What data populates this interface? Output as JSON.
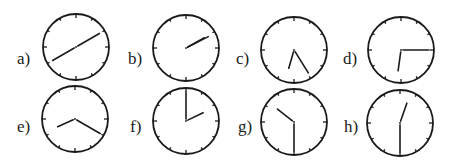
{
  "figure": {
    "clocks": [
      {
        "label": "a)",
        "cx": 76,
        "cy": 47,
        "r": 33,
        "lx": 17,
        "ly": 50,
        "hands": [
          {
            "angle": 60,
            "len": 27,
            "role": "hand-1"
          },
          {
            "angle": 240,
            "len": 27,
            "role": "hand-2"
          }
        ]
      },
      {
        "label": "b)",
        "cx": 186,
        "cy": 48,
        "r": 33,
        "lx": 128,
        "ly": 50,
        "hands": [
          {
            "angle": 63,
            "len": 25,
            "role": "long-hand"
          },
          {
            "angle": 61,
            "len": 21,
            "role": "short-hand"
          }
        ]
      },
      {
        "label": "c)",
        "cx": 294,
        "cy": 50,
        "r": 33,
        "lx": 236,
        "ly": 50,
        "hands": [
          {
            "angle": 148,
            "len": 27,
            "role": "long-hand"
          },
          {
            "angle": 196,
            "len": 19,
            "role": "short-hand"
          }
        ]
      },
      {
        "label": "d)",
        "cx": 401,
        "cy": 50,
        "r": 33,
        "lx": 343,
        "ly": 50,
        "hands": [
          {
            "angle": 90,
            "len": 28,
            "role": "long-hand"
          },
          {
            "angle": 188,
            "len": 21,
            "role": "short-hand"
          }
        ]
      },
      {
        "label": "e)",
        "cx": 75,
        "cy": 119,
        "r": 33,
        "lx": 17,
        "ly": 118,
        "hands": [
          {
            "angle": 120,
            "len": 29,
            "role": "long-hand"
          },
          {
            "angle": 246,
            "len": 19,
            "role": "short-hand"
          }
        ]
      },
      {
        "label": "f)",
        "cx": 186,
        "cy": 121,
        "r": 33,
        "lx": 130,
        "ly": 118,
        "hands": [
          {
            "angle": 0,
            "len": 29,
            "role": "long-hand"
          },
          {
            "angle": 64,
            "len": 19,
            "role": "short-hand"
          }
        ]
      },
      {
        "label": "g)",
        "cx": 294,
        "cy": 122,
        "r": 33,
        "lx": 238,
        "ly": 118,
        "hands": [
          {
            "angle": 180,
            "len": 29,
            "role": "long-hand"
          },
          {
            "angle": 308,
            "len": 21,
            "role": "short-hand"
          }
        ]
      },
      {
        "label": "h)",
        "cx": 400,
        "cy": 123,
        "r": 33,
        "lx": 344,
        "ly": 118,
        "hands": [
          {
            "angle": 180,
            "len": 29,
            "role": "long-hand"
          },
          {
            "angle": 19,
            "len": 21,
            "role": "short-hand"
          }
        ]
      }
    ],
    "stroke_color": "#1a1a1a",
    "background": "#ffffff"
  }
}
